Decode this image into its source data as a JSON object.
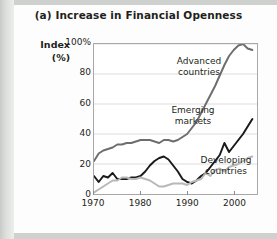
{
  "figure": {
    "title": "(a) Increase in Financial Openness",
    "y_axis_label_line1": "Index",
    "y_axis_label_line2": "(%)"
  },
  "colors": {
    "advanced": "#6e6e6e",
    "emerging": "#1a1a1a",
    "developing": "#b8b8b8",
    "grid": "#dcdcdc",
    "frame": "#a8a8a8",
    "text": "#231f20",
    "page_background": "#e3e4e3",
    "card_background": "#fdfdfd"
  },
  "annotations": {
    "advanced_line1": "Advanced",
    "advanced_line2": "countries",
    "emerging_line1": "Emerging",
    "emerging_line2": "markets",
    "developing_line1": "Developing",
    "developing_line2": "countries"
  },
  "chart_data": {
    "type": "line",
    "title": "(a) Increase in Financial Openness",
    "xlabel": "",
    "ylabel": "Index (%)",
    "xlim": [
      1970,
      2005
    ],
    "ylim": [
      0,
      100
    ],
    "grid": true,
    "legend_position": "inline-annotations",
    "ytick_labels": [
      "100%",
      "80",
      "60",
      "40",
      "20",
      "0"
    ],
    "ytick_values": [
      100,
      80,
      60,
      40,
      20,
      0
    ],
    "xtick_labels": [
      "1970",
      "1980",
      "1990",
      "2000"
    ],
    "xtick_values": [
      1970,
      1980,
      1990,
      2000
    ],
    "x": [
      1970,
      1971,
      1972,
      1973,
      1974,
      1975,
      1976,
      1977,
      1978,
      1979,
      1980,
      1981,
      1982,
      1983,
      1984,
      1985,
      1986,
      1987,
      1988,
      1989,
      1990,
      1991,
      1992,
      1993,
      1994,
      1995,
      1996,
      1997,
      1998,
      1999,
      2000,
      2001,
      2002,
      2003,
      2004
    ],
    "series": [
      {
        "name": "Advanced countries",
        "color": "#6e6e6e",
        "values": [
          22,
          27,
          29,
          30,
          31,
          33,
          33,
          34,
          34,
          35,
          36,
          36,
          36,
          35,
          34,
          36,
          36,
          35,
          36,
          38,
          40,
          44,
          48,
          54,
          60,
          66,
          72,
          79,
          86,
          92,
          96,
          99,
          100,
          97,
          96
        ]
      },
      {
        "name": "Emerging markets",
        "color": "#1a1a1a",
        "values": [
          12,
          8,
          12,
          11,
          14,
          10,
          10,
          10,
          11,
          11,
          12,
          15,
          19,
          22,
          24,
          25,
          23,
          19,
          15,
          10,
          8,
          7,
          9,
          12,
          14,
          18,
          22,
          26,
          34,
          28,
          32,
          36,
          40,
          45,
          50
        ]
      },
      {
        "name": "Developing countries",
        "color": "#b8b8b8",
        "values": [
          1,
          3,
          5,
          7,
          9,
          9,
          11,
          11,
          10,
          10,
          11,
          10,
          9,
          7,
          5,
          5,
          6,
          7,
          7,
          7,
          6,
          8,
          9,
          10,
          14,
          12,
          16,
          17,
          15,
          18,
          19,
          20,
          22,
          24,
          25
        ]
      }
    ]
  }
}
